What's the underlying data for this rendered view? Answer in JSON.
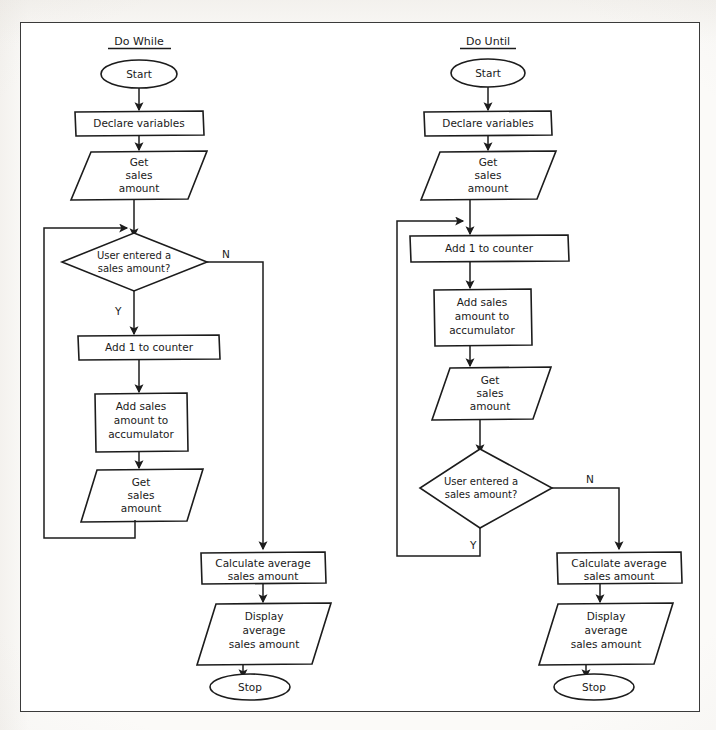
{
  "page": {
    "background_color": "#fbfaf8",
    "frame_color": "#3a3a3a",
    "ink_color": "#1c1c1c"
  },
  "flowcharts": [
    {
      "id": "do-while",
      "title": "Do While",
      "nodes": [
        {
          "id": "start",
          "type": "terminator",
          "label": "Start"
        },
        {
          "id": "declare",
          "type": "process",
          "label": "Declare variables"
        },
        {
          "id": "get1",
          "type": "input-output",
          "label": "Get\nsales\namount"
        },
        {
          "id": "decision",
          "type": "decision",
          "label": "User entered a\nsales amount?"
        },
        {
          "id": "counter",
          "type": "process",
          "label": "Add 1 to counter"
        },
        {
          "id": "accumulate",
          "type": "process",
          "label": "Add sales\namount to\naccumulator"
        },
        {
          "id": "get2",
          "type": "input-output",
          "label": "Get\nsales\namount"
        },
        {
          "id": "calc",
          "type": "process",
          "label": "Calculate average\nsales amount"
        },
        {
          "id": "display",
          "type": "input-output",
          "label": "Display\naverage\nsales amount"
        },
        {
          "id": "stop",
          "type": "terminator",
          "label": "Stop"
        }
      ],
      "branch_labels": {
        "yes": "Y",
        "no": "N"
      },
      "edges": [
        {
          "from": "start",
          "to": "declare",
          "label": ""
        },
        {
          "from": "declare",
          "to": "get1",
          "label": ""
        },
        {
          "from": "get1",
          "to": "decision",
          "label": ""
        },
        {
          "from": "decision",
          "to": "counter",
          "label": "Y"
        },
        {
          "from": "decision",
          "to": "calc",
          "label": "N"
        },
        {
          "from": "counter",
          "to": "accumulate",
          "label": ""
        },
        {
          "from": "accumulate",
          "to": "get2",
          "label": ""
        },
        {
          "from": "get2",
          "to": "decision",
          "label": ""
        },
        {
          "from": "calc",
          "to": "display",
          "label": ""
        },
        {
          "from": "display",
          "to": "stop",
          "label": ""
        }
      ]
    },
    {
      "id": "do-until",
      "title": "Do Until",
      "nodes": [
        {
          "id": "start",
          "type": "terminator",
          "label": "Start"
        },
        {
          "id": "declare",
          "type": "process",
          "label": "Declare variables"
        },
        {
          "id": "get1",
          "type": "input-output",
          "label": "Get\nsales\namount"
        },
        {
          "id": "counter",
          "type": "process",
          "label": "Add 1 to counter"
        },
        {
          "id": "accumulate",
          "type": "process",
          "label": "Add sales\namount to\naccumulator"
        },
        {
          "id": "get2",
          "type": "input-output",
          "label": "Get\nsales\namount"
        },
        {
          "id": "decision",
          "type": "decision",
          "label": "User entered a\nsales amount?"
        },
        {
          "id": "calc",
          "type": "process",
          "label": "Calculate average\nsales amount"
        },
        {
          "id": "display",
          "type": "input-output",
          "label": "Display\naverage\nsales amount"
        },
        {
          "id": "stop",
          "type": "terminator",
          "label": "Stop"
        }
      ],
      "branch_labels": {
        "yes": "Y",
        "no": "N"
      },
      "edges": [
        {
          "from": "start",
          "to": "declare",
          "label": ""
        },
        {
          "from": "declare",
          "to": "get1",
          "label": ""
        },
        {
          "from": "get1",
          "to": "counter",
          "label": ""
        },
        {
          "from": "counter",
          "to": "accumulate",
          "label": ""
        },
        {
          "from": "accumulate",
          "to": "get2",
          "label": ""
        },
        {
          "from": "get2",
          "to": "decision",
          "label": ""
        },
        {
          "from": "decision",
          "to": "counter",
          "label": "Y"
        },
        {
          "from": "decision",
          "to": "calc",
          "label": "N"
        },
        {
          "from": "calc",
          "to": "display",
          "label": ""
        },
        {
          "from": "display",
          "to": "stop",
          "label": ""
        }
      ]
    }
  ],
  "text": {
    "left": {
      "title": "Do While",
      "start": "Start",
      "declare": "Declare variables",
      "get1_l1": "Get",
      "get1_l2": "sales",
      "get1_l3": "amount",
      "decision_l1": "User entered a",
      "decision_l2": "sales amount?",
      "yes": "Y",
      "no": "N",
      "counter": "Add 1 to counter",
      "accum_l1": "Add sales",
      "accum_l2": "amount to",
      "accum_l3": "accumulator",
      "get2_l1": "Get",
      "get2_l2": "sales",
      "get2_l3": "amount",
      "calc_l1": "Calculate average",
      "calc_l2": "sales amount",
      "display_l1": "Display",
      "display_l2": "average",
      "display_l3": "sales amount",
      "stop": "Stop"
    },
    "right": {
      "title": "Do Until",
      "start": "Start",
      "declare": "Declare variables",
      "get1_l1": "Get",
      "get1_l2": "sales",
      "get1_l3": "amount",
      "counter": "Add 1 to counter",
      "accum_l1": "Add sales",
      "accum_l2": "amount to",
      "accum_l3": "accumulator",
      "get2_l1": "Get",
      "get2_l2": "sales",
      "get2_l3": "amount",
      "decision_l1": "User entered a",
      "decision_l2": "sales amount?",
      "yes": "Y",
      "no": "N",
      "calc_l1": "Calculate average",
      "calc_l2": "sales amount",
      "display_l1": "Display",
      "display_l2": "average",
      "display_l3": "sales amount",
      "stop": "Stop"
    }
  }
}
